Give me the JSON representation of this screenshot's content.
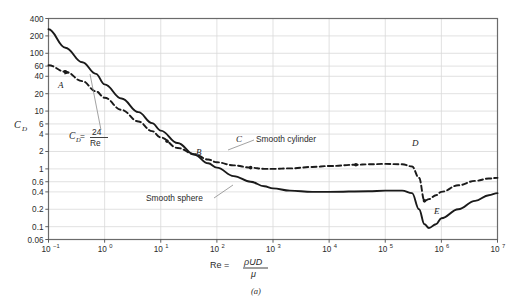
{
  "figure": {
    "caption": "(a)",
    "ylabel_main": "C",
    "ylabel_sub": "D",
    "xlabel_prefix": "Re = ",
    "xlabel_numerator": "ρUD",
    "xlabel_denominator": "μ"
  },
  "annotations": {
    "stokes_lhs": "C",
    "stokes_lhs_sub": "D",
    "stokes_eq": " = ",
    "stokes_num": "24",
    "stokes_den": "Re",
    "cylinder_label": "Smooth cylinder",
    "sphere_label": "Smooth sphere",
    "points": [
      {
        "id": "A",
        "label": "A",
        "x": 0.2,
        "y": 48,
        "lx": 58,
        "ly": 88
      },
      {
        "id": "B",
        "label": "B",
        "x": 13,
        "y": 3.0,
        "lx": 196,
        "ly": 155
      },
      {
        "id": "C",
        "label": "C",
        "x": 400,
        "y": 1.05,
        "lx": 236,
        "ly": 142
      },
      {
        "id": "D",
        "label": "D",
        "x": 30000,
        "y": 1.18,
        "lx": 412,
        "ly": 146
      },
      {
        "id": "E",
        "label": "E",
        "x": 500000,
        "y": 0.28,
        "lx": 434,
        "ly": 214
      }
    ]
  },
  "colors": {
    "curve": "#1a1a1a",
    "grid": "#d9d9d9",
    "axis": "#555555",
    "background": "#ffffff",
    "leader": "#8a8a8a"
  },
  "chart_data": {
    "type": "line",
    "title": "",
    "xlabel": "Re = ρUD/μ",
    "ylabel": "C_D",
    "xscale": "log",
    "yscale": "log",
    "xlim": [
      0.1,
      10000000
    ],
    "ylim": [
      0.06,
      400
    ],
    "grid": true,
    "legend_position": "inline-annotations",
    "xticks": [
      0.1,
      1,
      10,
      100,
      1000,
      10000,
      100000,
      1000000,
      10000000
    ],
    "xticklabels": [
      "10⁻¹",
      "10⁰",
      "10¹",
      "10²",
      "10³",
      "10⁴",
      "10⁵",
      "10⁶",
      "10⁷"
    ],
    "yticks": [
      400,
      200,
      100,
      60,
      40,
      20,
      10,
      6,
      4,
      2,
      1,
      0.6,
      0.4,
      0.2,
      0.1,
      0.06
    ],
    "yticklabels": [
      "400",
      "200",
      "100",
      "60",
      "40",
      "20",
      "10",
      "6",
      "4",
      "2",
      "1",
      "0.6",
      "0.4",
      "0.2",
      "0.1",
      "0.06"
    ],
    "series": [
      {
        "name": "Smooth sphere",
        "style": "solid",
        "x": [
          0.1,
          0.2,
          0.4,
          0.7,
          1,
          2,
          4,
          7,
          10,
          20,
          40,
          70,
          100,
          200,
          400,
          700,
          1000,
          2000,
          5000,
          10000,
          50000,
          100000,
          200000,
          300000,
          400000,
          500000,
          600000,
          800000,
          1000000,
          2000000,
          4000000,
          7000000,
          10000000
        ],
        "y": [
          260,
          125,
          70,
          44,
          29,
          16.5,
          9.6,
          6.2,
          4.6,
          2.8,
          1.75,
          1.25,
          1.05,
          0.75,
          0.6,
          0.5,
          0.46,
          0.42,
          0.4,
          0.4,
          0.41,
          0.42,
          0.42,
          0.38,
          0.2,
          0.11,
          0.095,
          0.11,
          0.14,
          0.2,
          0.28,
          0.35,
          0.38
        ]
      },
      {
        "name": "Smooth cylinder",
        "style": "dashed",
        "x": [
          0.1,
          0.2,
          0.4,
          0.7,
          1,
          2,
          4,
          7,
          10,
          20,
          40,
          70,
          100,
          200,
          400,
          700,
          1000,
          2000,
          5000,
          10000,
          30000,
          50000,
          100000,
          200000,
          300000,
          400000,
          500000,
          600000,
          800000,
          1000000,
          2000000,
          4000000,
          7000000,
          10000000
        ],
        "y": [
          62,
          48,
          33,
          22,
          17,
          10.5,
          6.6,
          4.5,
          3.5,
          2.3,
          1.8,
          1.45,
          1.3,
          1.15,
          1.05,
          1.0,
          1.0,
          1.02,
          1.08,
          1.12,
          1.18,
          1.2,
          1.22,
          1.2,
          1.1,
          0.7,
          0.28,
          0.3,
          0.35,
          0.4,
          0.52,
          0.62,
          0.68,
          0.7
        ]
      }
    ]
  }
}
